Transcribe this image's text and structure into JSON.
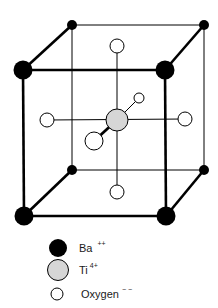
{
  "diagram": {
    "title": "",
    "colors": {
      "barium": "#000000",
      "titanium": "#d6d6d6",
      "oxygen": "#ffffff",
      "stroke": "#000000"
    },
    "atoms": {
      "barium_front": [
        {
          "id": "ba-front-top-left",
          "x": 23,
          "y": 70,
          "r": 9.5
        },
        {
          "id": "ba-front-top-right",
          "x": 165,
          "y": 70,
          "r": 9.5
        },
        {
          "id": "ba-front-bottom-left",
          "x": 24,
          "y": 216,
          "r": 9.5
        },
        {
          "id": "ba-front-bottom-right",
          "x": 166,
          "y": 216,
          "r": 9.5
        }
      ],
      "barium_back": [
        {
          "id": "ba-back-top-left",
          "x": 72,
          "y": 25,
          "r": 5
        },
        {
          "id": "ba-back-top-right",
          "x": 204,
          "y": 25,
          "r": 5
        },
        {
          "id": "ba-back-bottom-left",
          "x": 72,
          "y": 170,
          "r": 5
        },
        {
          "id": "ba-back-bottom-right",
          "x": 204,
          "y": 170,
          "r": 5
        }
      ],
      "titanium": {
        "id": "ti-center",
        "x": 117,
        "y": 120,
        "r": 11
      },
      "oxygen": [
        {
          "id": "o-top",
          "x": 117,
          "y": 46,
          "r": 7
        },
        {
          "id": "o-bottom",
          "x": 117,
          "y": 192,
          "r": 7
        },
        {
          "id": "o-left",
          "x": 47,
          "y": 120,
          "r": 7
        },
        {
          "id": "o-right",
          "x": 185,
          "y": 119,
          "r": 7
        },
        {
          "id": "o-front",
          "x": 94,
          "y": 141,
          "r": 9
        },
        {
          "id": "o-back",
          "x": 139,
          "y": 98,
          "r": 5
        }
      ]
    }
  },
  "legend": {
    "items": [
      {
        "name": "legend-barium",
        "symbol": "Ba",
        "charge": "++",
        "fill": "#000000"
      },
      {
        "name": "legend-titanium",
        "symbol": "Ti",
        "charge": "4+",
        "fill": "#d6d6d6"
      },
      {
        "name": "legend-oxygen",
        "symbol": "Oxygen",
        "charge": "− −",
        "fill": "#ffffff"
      }
    ]
  }
}
